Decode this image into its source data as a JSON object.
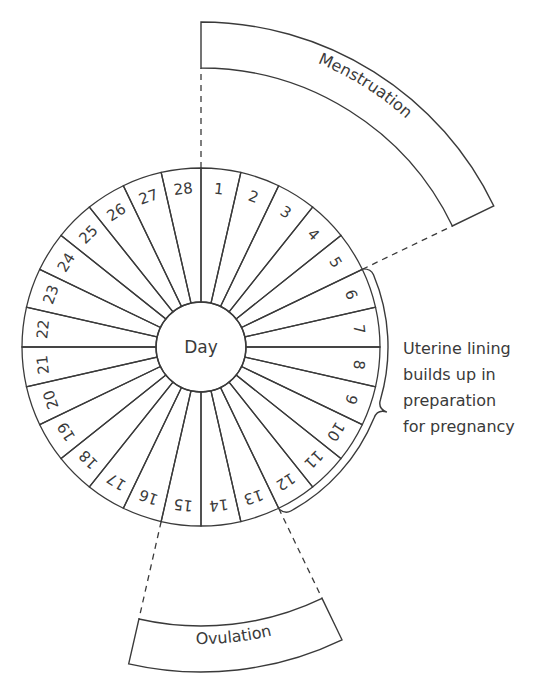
{
  "diagram": {
    "center_label": "Day",
    "days": [
      "1",
      "2",
      "3",
      "4",
      "5",
      "6",
      "7",
      "8",
      "9",
      "10",
      "11",
      "12",
      "13",
      "14",
      "15",
      "16",
      "17",
      "18",
      "19",
      "20",
      "21",
      "22",
      "23",
      "24",
      "25",
      "26",
      "27",
      "28"
    ],
    "shaded_days": [
      1,
      2,
      3,
      4,
      5,
      13,
      14,
      15
    ],
    "phases": [
      {
        "name": "menstruation",
        "label": "Menstruation",
        "days": [
          1,
          5
        ]
      },
      {
        "name": "ovulation",
        "label": "Ovulation",
        "days": [
          13,
          15
        ]
      },
      {
        "name": "uterine-lining",
        "days": [
          6,
          12
        ]
      }
    ],
    "side_note": {
      "lines": [
        "Uterine lining",
        "builds up in",
        "preparation",
        "for pregnancy"
      ]
    },
    "colors": {
      "shade": "#8e8e8e",
      "line": "#3a3a3a",
      "background": "#ffffff"
    }
  }
}
